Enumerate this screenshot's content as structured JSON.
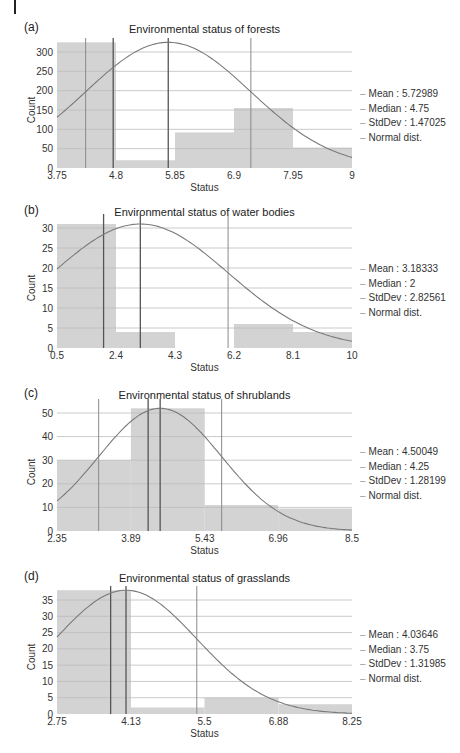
{
  "colors": {
    "bar_fill": "#d3d3d3",
    "grid": "#bdbdbd",
    "curve": "#7a7a7a",
    "stat_line_dark": "#555555",
    "stat_line_light": "#8a8a8a"
  },
  "panels": [
    {
      "letter": "(a)",
      "title": "Environmental status of forests",
      "legend": [
        "Mean : 5.72989",
        "Median : 4.75",
        "StdDev : 1.47025",
        "Normal dist."
      ]
    },
    {
      "letter": "(b)",
      "title": "Environmental status of water bodies",
      "legend": [
        "Mean : 3.18333",
        "Median : 2",
        "StdDev : 2.82561",
        "Normal dist."
      ]
    },
    {
      "letter": "(c)",
      "title": "Environmental status of shrublands",
      "legend": [
        "Mean : 4.50049",
        "Median : 4.25",
        "StdDev : 1.28199",
        "Normal dist."
      ]
    },
    {
      "letter": "(d)",
      "title": "Environmental status of grasslands",
      "legend": [
        "Mean : 4.03646",
        "Median : 3.75",
        "StdDev : 1.31985",
        "Normal dist."
      ]
    }
  ],
  "chart_data": [
    {
      "type": "bar",
      "title": "Environmental status of forests",
      "xlabel": "Status",
      "ylabel": "Count",
      "xlim": [
        3.75,
        9
      ],
      "ylim": [
        0,
        330
      ],
      "x_ticks": [
        "3.75",
        "4.8",
        "5.85",
        "6.9",
        "7.95",
        "9"
      ],
      "y_ticks": [
        0,
        50,
        100,
        150,
        200,
        250,
        300
      ],
      "bins": [
        [
          3.75,
          4.8
        ],
        [
          4.8,
          5.85
        ],
        [
          5.85,
          6.9
        ],
        [
          6.9,
          7.95
        ],
        [
          7.95,
          9
        ]
      ],
      "values": [
        325,
        20,
        92,
        155,
        53
      ],
      "mean": 5.72989,
      "median": 4.75,
      "stddev": 1.47025,
      "normal_peak": 325,
      "legend": [
        "Mean : 5.72989",
        "Median : 4.75",
        "StdDev : 1.47025",
        "Normal dist."
      ],
      "grid": true,
      "legend_position": "right"
    },
    {
      "type": "bar",
      "title": "Environmental status of water bodies",
      "xlabel": "Status",
      "ylabel": "Count",
      "xlim": [
        0.5,
        10
      ],
      "ylim": [
        0,
        32
      ],
      "x_ticks": [
        "0.5",
        "2.4",
        "4.3",
        "6.2",
        "8.1",
        "10"
      ],
      "y_ticks": [
        0,
        5,
        10,
        15,
        20,
        25,
        30
      ],
      "bins": [
        [
          0.5,
          2.4
        ],
        [
          2.4,
          4.3
        ],
        [
          4.3,
          6.2
        ],
        [
          6.2,
          8.1
        ],
        [
          8.1,
          10
        ]
      ],
      "values": [
        31,
        4,
        0,
        6,
        4
      ],
      "mean": 3.18333,
      "median": 2,
      "stddev": 2.82561,
      "normal_peak": 31,
      "legend": [
        "Mean : 3.18333",
        "Median : 2",
        "StdDev : 2.82561",
        "Normal dist."
      ],
      "grid": true,
      "legend_position": "right"
    },
    {
      "type": "bar",
      "title": "Environmental status of shrublands",
      "xlabel": "Status",
      "ylabel": "Count",
      "xlim": [
        2.35,
        8.5
      ],
      "ylim": [
        0,
        55
      ],
      "x_ticks": [
        "2.35",
        "3.89",
        "5.43",
        "6.96",
        "8.5"
      ],
      "y_ticks": [
        0,
        10,
        20,
        30,
        40,
        50
      ],
      "bins": [
        [
          2.35,
          3.89
        ],
        [
          3.89,
          5.43
        ],
        [
          5.43,
          6.96
        ],
        [
          6.96,
          8.5
        ]
      ],
      "values": [
        30,
        52,
        11,
        9.5
      ],
      "mean": 4.50049,
      "median": 4.25,
      "stddev": 1.28199,
      "normal_peak": 52,
      "legend": [
        "Mean : 4.50049",
        "Median : 4.25",
        "StdDev : 1.28199",
        "Normal dist."
      ],
      "grid": true,
      "legend_position": "right"
    },
    {
      "type": "bar",
      "title": "Environmental status of grasslands",
      "xlabel": "Status",
      "ylabel": "Count",
      "xlim": [
        2.75,
        8.25
      ],
      "ylim": [
        0,
        39
      ],
      "x_ticks": [
        "2.75",
        "4.13",
        "5.5",
        "6.88",
        "8.25"
      ],
      "y_ticks": [
        0,
        5,
        10,
        15,
        20,
        25,
        30,
        35
      ],
      "bins": [
        [
          2.75,
          4.13
        ],
        [
          4.13,
          5.5
        ],
        [
          5.5,
          6.88
        ],
        [
          6.88,
          8.25
        ]
      ],
      "values": [
        38,
        2,
        5,
        3
      ],
      "mean": 4.03646,
      "median": 3.75,
      "stddev": 1.31985,
      "normal_peak": 38,
      "legend": [
        "Mean : 4.03646",
        "Median : 3.75",
        "StdDev : 1.31985",
        "Normal dist."
      ],
      "grid": true,
      "legend_position": "right"
    }
  ]
}
